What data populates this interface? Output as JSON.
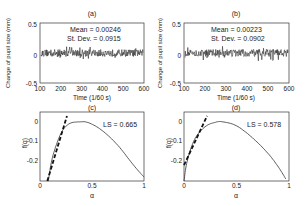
{
  "chart_data": [
    {
      "panel": "a",
      "type": "line",
      "title": "(a)",
      "xlabel": "Time (1/60 s)",
      "ylabel": "Change of pupil size (mm)",
      "xlim": [
        100,
        600
      ],
      "ylim": [
        -0.5,
        0.5
      ],
      "xticks": [
        100,
        200,
        300,
        400,
        500,
        600
      ],
      "yticks": [
        -0.5,
        0,
        0.5
      ],
      "annotations": [
        "Mean = 0.00246",
        "St. Dev. = 0.0915"
      ],
      "series": [
        {
          "name": "pupil size change",
          "description": "noise-like fluctuation around 0, amplitude about ±0.1"
        }
      ]
    },
    {
      "panel": "b",
      "type": "line",
      "title": "(b)",
      "xlabel": "Time (1/60 s)",
      "ylabel": "Change of pupil size (mm)",
      "xlim": [
        100,
        600
      ],
      "ylim": [
        -0.5,
        0.5
      ],
      "xticks": [
        100,
        200,
        300,
        400,
        500,
        600
      ],
      "yticks": [
        -0.5,
        0,
        0.5
      ],
      "annotations": [
        "Mean = 0.00223",
        "St. Dev. = 0.0902"
      ],
      "series": [
        {
          "name": "pupil size change",
          "description": "noise-like fluctuation around 0, amplitude about ±0.1"
        }
      ]
    },
    {
      "panel": "c",
      "type": "line",
      "title": "(c)",
      "xlabel": "α",
      "ylabel": "f(α)",
      "xlim": [
        0,
        1
      ],
      "ylim": [
        -0.3,
        0.05
      ],
      "xticks": [
        0,
        0.5,
        1
      ],
      "yticks": [
        -0.2,
        -0.1,
        0
      ],
      "annotations": [
        "LS = 0.665"
      ],
      "series": [
        {
          "name": "f(alpha) spectrum",
          "x": [
            0.08,
            0.12,
            0.2,
            0.28,
            0.38,
            0.47,
            0.6,
            0.75,
            0.9,
            1.0
          ],
          "y": [
            -0.3,
            -0.18,
            -0.06,
            -0.01,
            0.0,
            -0.005,
            -0.045,
            -0.12,
            -0.22,
            -0.28
          ]
        },
        {
          "name": "linear fit (dashed)",
          "x": [
            0.07,
            0.26
          ],
          "y": [
            -0.3,
            0.03
          ]
        }
      ]
    },
    {
      "panel": "d",
      "type": "line",
      "title": "(d)",
      "xlabel": "α",
      "ylabel": "f(α)",
      "xlim": [
        0,
        1
      ],
      "ylim": [
        -0.3,
        0.05
      ],
      "xticks": [
        0,
        0.5,
        1
      ],
      "yticks": [
        -0.2,
        -0.1,
        0
      ],
      "annotations": [
        "LS = 0.578"
      ],
      "series": [
        {
          "name": "f(alpha) spectrum",
          "x": [
            0.0,
            0.03,
            0.1,
            0.2,
            0.3,
            0.37,
            0.5,
            0.65,
            0.8,
            0.9,
            0.97
          ],
          "y": [
            -0.3,
            -0.2,
            -0.09,
            -0.025,
            -0.002,
            0.0,
            -0.02,
            -0.08,
            -0.16,
            -0.23,
            -0.29
          ]
        },
        {
          "name": "linear fit (dashed)",
          "x": [
            0.0,
            0.22
          ],
          "y": [
            -0.22,
            0.03
          ]
        }
      ]
    }
  ],
  "labels": {
    "a": {
      "title": "(a)",
      "mean": "Mean = 0.00246",
      "std": "St. Dev. = 0.0915"
    },
    "b": {
      "title": "(b)",
      "mean": "Mean = 0.00223",
      "std": "St. Dev. = 0.0902"
    },
    "c": {
      "title": "(c)",
      "ls": "LS = 0.665"
    },
    "d": {
      "title": "(d)",
      "ls": "LS = 0.578"
    },
    "time_xlabel": "Time (1/60 s)",
    "pupil_ylabel": "Change of pupil size (mm)",
    "alpha_xlabel": "α",
    "falpha_ylabel": "f(α)",
    "time_ticks": [
      "100",
      "200",
      "300",
      "400",
      "500",
      "600"
    ],
    "pupil_ticks": [
      "0.5",
      "0",
      "-0.5"
    ],
    "alpha_ticks": [
      "0",
      "0.5",
      "1"
    ],
    "f_ticks": [
      "0",
      "-0.1",
      "-0.2"
    ]
  }
}
